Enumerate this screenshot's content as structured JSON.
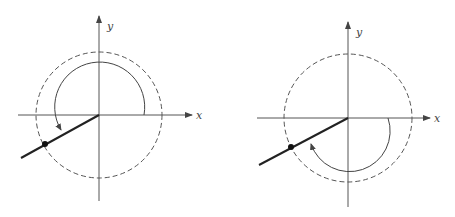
{
  "figures": [
    {
      "id": "left",
      "description": "Angle measured counterclockwise (positive rotation) to terminal side in third quadrant",
      "axis_labels": {
        "x": "x",
        "y": "y"
      },
      "rotation_direction": "counterclockwise",
      "geometry": {
        "origin": [
          99,
          115
        ],
        "circle_radius": 63,
        "arc_radius": 45,
        "x_axis": [
          18,
          192
        ],
        "y_axis": [
          16,
          201
        ],
        "terminal_point": [
          45,
          144
        ],
        "terminal_end": [
          21,
          158
        ]
      }
    },
    {
      "id": "right",
      "description": "Angle measured clockwise (negative rotation) to the same terminal side in third quadrant",
      "axis_labels": {
        "x": "x",
        "y": "y"
      },
      "rotation_direction": "clockwise",
      "geometry": {
        "origin": [
          348,
          118
        ],
        "circle_radius": 64,
        "arc_radius": 40,
        "x_axis": [
          257,
          430
        ],
        "y_axis": [
          22,
          207
        ],
        "terminal_point": [
          291,
          147
        ],
        "terminal_end": [
          259,
          165
        ]
      }
    }
  ],
  "colors": {
    "axis": "#555555",
    "circle": "#555555",
    "terminal": "#222222",
    "arc": "#444444"
  }
}
